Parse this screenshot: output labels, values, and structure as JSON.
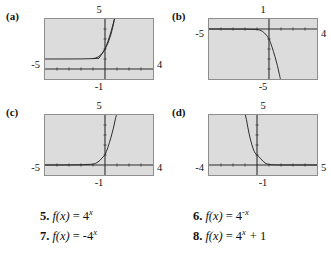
{
  "page": {
    "background_color": "#ffffff",
    "screen_fill": "#dcdcdc",
    "screen_border": "#8e8e8e",
    "curve_color": "#2a2a2a"
  },
  "figure": {
    "panels": [
      {
        "id": "a",
        "letter": "(a)",
        "labels": {
          "top": "5",
          "left": "-5",
          "right": "4",
          "bottom": "-1"
        },
        "window": {
          "xmin": -5,
          "xmax": 4,
          "ymin": -1,
          "ymax": 5
        },
        "function": "4^x + 1",
        "asymptote_y": 1,
        "description": "increasing exponential with horizontal asymptote above the x-axis"
      },
      {
        "id": "b",
        "letter": "(b)",
        "labels": {
          "top": "1",
          "left": "-5",
          "right": "4",
          "bottom": "-5"
        },
        "window": {
          "xmin": -5,
          "xmax": 4,
          "ymin": -5,
          "ymax": 1
        },
        "function": "-4^x",
        "asymptote_y": 0,
        "description": "decreasing reflected exponential falling below the x-axis"
      },
      {
        "id": "c",
        "letter": "(c)",
        "labels": {
          "top": "5",
          "left": "-5",
          "right": "4",
          "bottom": "-1"
        },
        "window": {
          "xmin": -5,
          "xmax": 4,
          "ymin": -1,
          "ymax": 5
        },
        "function": "4^x",
        "asymptote_y": 0,
        "description": "increasing exponential with horizontal asymptote on the x-axis"
      },
      {
        "id": "d",
        "letter": "(d)",
        "labels": {
          "top": "5",
          "left": "-4",
          "right": "5",
          "bottom": "-1"
        },
        "window": {
          "xmin": -4,
          "xmax": 5,
          "ymin": -1,
          "ymax": 5
        },
        "function": "4^(-x)",
        "asymptote_y": 0,
        "description": "decaying exponential approaching the x-axis to the right"
      }
    ]
  },
  "exercises": [
    {
      "number": "5.",
      "fn": "f",
      "arg": "(x)",
      "eq": "=",
      "base": "4",
      "exponent": "x",
      "extra": ""
    },
    {
      "number": "6.",
      "fn": "f",
      "arg": "(x)",
      "eq": "=",
      "base": "4",
      "exponent": "-x",
      "extra": ""
    },
    {
      "number": "7.",
      "fn": "f",
      "arg": "(x)",
      "eq": "=",
      "base": "-4",
      "exponent": "x",
      "extra": ""
    },
    {
      "number": "8.",
      "fn": "f",
      "arg": "(x)",
      "eq": "=",
      "base": "4",
      "exponent": "x",
      "extra": "+ 1"
    }
  ]
}
